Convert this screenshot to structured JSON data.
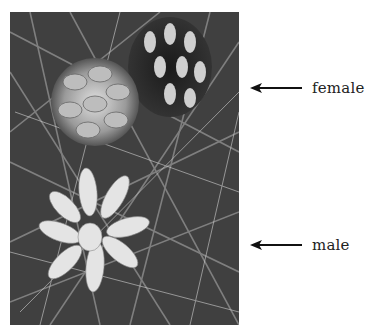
{
  "figure": {
    "image_description": "Black and white photograph of pine branch with a female cone (open, top) and clusters of male cones (bottom) among pine needles",
    "labels": [
      {
        "id": "female",
        "text": "female"
      },
      {
        "id": "male",
        "text": "male"
      }
    ],
    "colors": {
      "text": "#222222",
      "arrow": "#111111",
      "background": "#ffffff"
    }
  }
}
